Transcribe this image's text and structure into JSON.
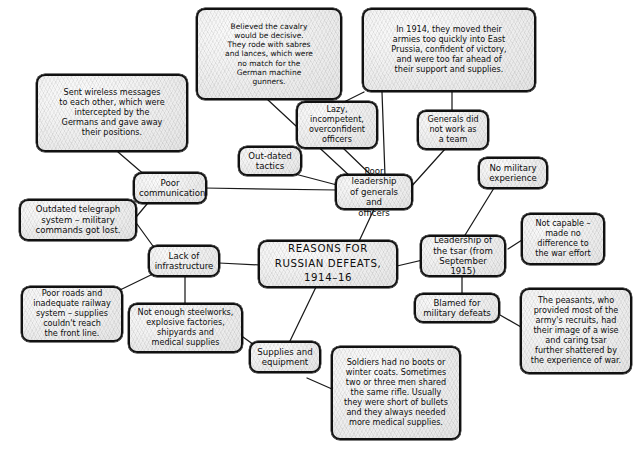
{
  "diagram": {
    "central": {
      "label": "REASONS FOR\nRUSSIAN DEFEATS,\n1914–16"
    },
    "nodes": [
      {
        "id": "cavalry",
        "label": "Believed the cavalry\nwould be decisive.\nThey rode with sabres\nand lances, which were\nno match for the\nGerman machine\ngunners."
      },
      {
        "id": "east-prussia",
        "label": "In 1914, they moved their\narmies too quickly into East\nPrussia, confident of victory,\nand were too far ahead of\ntheir support and supplies."
      },
      {
        "id": "wireless",
        "label": "Sent wireless messages\nto each other, which were\nintercepted by the\nGermans and gave away\ntheir positions."
      },
      {
        "id": "lazy-officers",
        "label": "Lazy,\nincompetent,\noverconfident\nofficers"
      },
      {
        "id": "generals-team",
        "label": "Generals did\nnot work as\na team"
      },
      {
        "id": "outdated-tactics",
        "label": "Out-dated\ntactics"
      },
      {
        "id": "poor-comms",
        "label": "Poor\ncommunication"
      },
      {
        "id": "poor-leadership",
        "label": "Poor leadership\nof generals and\nofficers"
      },
      {
        "id": "no-military-exp",
        "label": "No military\nexperience"
      },
      {
        "id": "telegraph",
        "label": "Outdated telegraph\nsystem – military\ncommands got lost."
      },
      {
        "id": "lack-infra",
        "label": "Lack of\ninfrastructure"
      },
      {
        "id": "tsar-leadership",
        "label": "Leadership of\nthe tsar (from\nSeptember 1915)"
      },
      {
        "id": "not-capable",
        "label": "Not capable –\nmade no\ndifference to\nthe war effort"
      },
      {
        "id": "poor-roads",
        "label": "Poor roads and\ninadequate railway\nsystem – supplies\ncouldn't reach\nthe front line."
      },
      {
        "id": "blamed",
        "label": "Blamed for\nmilitary defeats"
      },
      {
        "id": "peasants",
        "label": "The peasants, who\nprovided most of the\narmy's recruits, had\ntheir image of a wise\nand caring tsar\nfurther shattered by\nthe experience of war."
      },
      {
        "id": "not-enough",
        "label": "Not enough steelworks,\nexplosive factories,\nshipyards and\nmedical supplies"
      },
      {
        "id": "supplies",
        "label": "Supplies and\nequipment"
      },
      {
        "id": "soldiers",
        "label": "Soldiers had no boots or\nwinter coats. Sometimes\ntwo or three men shared\nthe same rifle. Usually\nthey were short of bullets\nand they always needed\nmore medical supplies."
      }
    ],
    "colors": {
      "stroke": "#111111",
      "fill": "#ebebeb",
      "background": "#ffffff"
    }
  }
}
